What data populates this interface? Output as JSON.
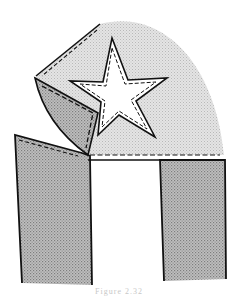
{
  "figure": {
    "caption": "Figure 2.32",
    "colors": {
      "outline": "#111111",
      "light_stipple": "#d9d9d9",
      "dark_stipple": "#a9a9a9",
      "background": "#ffffff"
    },
    "parts": [
      {
        "name": "fan-flap",
        "shade": "light"
      },
      {
        "name": "star-applique",
        "shade": "white"
      },
      {
        "name": "folded-corner",
        "shade": "dark"
      },
      {
        "name": "left-panel",
        "shade": "dark"
      },
      {
        "name": "center-gap",
        "shade": "white"
      },
      {
        "name": "right-panel",
        "shade": "dark"
      }
    ]
  }
}
